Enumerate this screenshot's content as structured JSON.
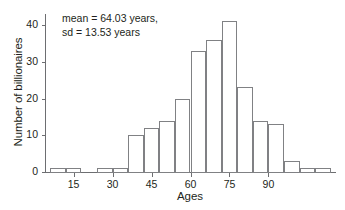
{
  "chart_data": {
    "type": "bar",
    "title": "",
    "xlabel": "Ages",
    "ylabel": "Number of billionaires",
    "categories": [
      "6-12",
      "12-18",
      "18-24",
      "24-30",
      "30-36",
      "36-42",
      "42-48",
      "48-54",
      "54-60",
      "60-66",
      "66-72",
      "72-78",
      "78-84",
      "84-90",
      "90-96",
      "96-102",
      "102-108"
    ],
    "bin_starts": [
      6,
      12,
      18,
      24,
      30,
      36,
      42,
      48,
      54,
      60,
      66,
      72,
      78,
      84,
      90,
      96,
      102
    ],
    "bin_width": 6,
    "values": [
      1,
      1,
      0,
      1,
      1,
      10,
      12,
      14,
      20,
      33,
      36,
      41,
      23,
      14,
      13,
      3,
      1
    ],
    "extra_bins": [
      {
        "start": 108,
        "value": 1
      }
    ],
    "xlim": [
      4,
      116
    ],
    "ylim": [
      0,
      43
    ],
    "xticks": [
      15,
      30,
      45,
      60,
      75,
      90
    ],
    "yticks": [
      0,
      10,
      20,
      30,
      40
    ],
    "grid": false,
    "legend": null,
    "annotations": [
      "mean = 64.03 years,",
      "sd = 13.53 years"
    ],
    "stats": {
      "mean": "64.03",
      "sd": "13.53",
      "units": "years"
    },
    "colors": {
      "bar_stroke": "#808184",
      "bar_fill": "transparent",
      "axis": "#6d6e71",
      "text": "#231f20",
      "background": "#ffffff"
    }
  }
}
